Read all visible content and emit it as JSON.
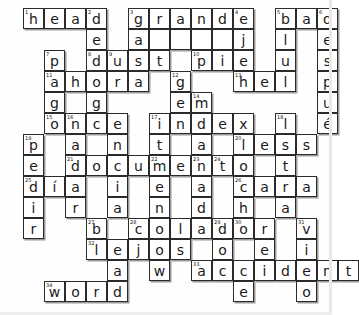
{
  "puzzle": {
    "title": "Crossword Puzzle",
    "grid_cols": 14,
    "grid_rows": 14,
    "cell_size": 21,
    "origin_x": 23,
    "origin_y": 8,
    "ink_color": "#2b2b2b",
    "shadow_color": "#9a9a9a",
    "background_color": "#ffffff",
    "cells": [
      {
        "r": 0,
        "c": 0,
        "letter": "h",
        "num": "1"
      },
      {
        "r": 0,
        "c": 1,
        "letter": "e",
        "num": ""
      },
      {
        "r": 0,
        "c": 2,
        "letter": "a",
        "num": ""
      },
      {
        "r": 0,
        "c": 3,
        "letter": "d",
        "num": "2"
      },
      {
        "r": 0,
        "c": 5,
        "letter": "g",
        "num": "3"
      },
      {
        "r": 0,
        "c": 6,
        "letter": "r",
        "num": ""
      },
      {
        "r": 0,
        "c": 7,
        "letter": "a",
        "num": ""
      },
      {
        "r": 0,
        "c": 8,
        "letter": "n",
        "num": ""
      },
      {
        "r": 0,
        "c": 9,
        "letter": "d",
        "num": ""
      },
      {
        "r": 0,
        "c": 10,
        "letter": "e",
        "num": "4"
      },
      {
        "r": 0,
        "c": 12,
        "letter": "b",
        "num": "5"
      },
      {
        "r": 0,
        "c": 13,
        "letter": "a",
        "num": ""
      },
      {
        "r": 0,
        "c": 14,
        "letter": "d",
        "num": "6"
      },
      {
        "r": 1,
        "c": 3,
        "letter": "e",
        "num": ""
      },
      {
        "r": 1,
        "c": 5,
        "letter": "a",
        "num": ""
      },
      {
        "r": 1,
        "c": 6,
        "letter": "",
        "num": ""
      },
      {
        "r": 1,
        "c": 7,
        "letter": "",
        "num": ""
      },
      {
        "r": 1,
        "c": 8,
        "letter": "",
        "num": ""
      },
      {
        "r": 1,
        "c": 9,
        "letter": "",
        "num": ""
      },
      {
        "r": 1,
        "c": 10,
        "letter": "j",
        "num": ""
      },
      {
        "r": 1,
        "c": 12,
        "letter": "l",
        "num": ""
      },
      {
        "r": 1,
        "c": 14,
        "letter": "e",
        "num": ""
      },
      {
        "r": 2,
        "c": 1,
        "letter": "p",
        "num": "7"
      },
      {
        "r": 2,
        "c": 3,
        "letter": "d",
        "num": "8"
      },
      {
        "r": 2,
        "c": 4,
        "letter": "u",
        "num": "9"
      },
      {
        "r": 2,
        "c": 5,
        "letter": "s",
        "num": ""
      },
      {
        "r": 2,
        "c": 6,
        "letter": "t",
        "num": ""
      },
      {
        "r": 2,
        "c": 8,
        "letter": "p",
        "num": "10"
      },
      {
        "r": 2,
        "c": 9,
        "letter": "i",
        "num": ""
      },
      {
        "r": 2,
        "c": 10,
        "letter": "e",
        "num": ""
      },
      {
        "r": 2,
        "c": 12,
        "letter": "u",
        "num": ""
      },
      {
        "r": 2,
        "c": 14,
        "letter": "s",
        "num": ""
      },
      {
        "r": 3,
        "c": 1,
        "letter": "a",
        "num": "11"
      },
      {
        "r": 3,
        "c": 2,
        "letter": "h",
        "num": ""
      },
      {
        "r": 3,
        "c": 3,
        "letter": "o",
        "num": ""
      },
      {
        "r": 3,
        "c": 4,
        "letter": "r",
        "num": ""
      },
      {
        "r": 3,
        "c": 5,
        "letter": "a",
        "num": ""
      },
      {
        "r": 3,
        "c": 7,
        "letter": "g",
        "num": "12"
      },
      {
        "r": 3,
        "c": 10,
        "letter": "h",
        "num": "13"
      },
      {
        "r": 3,
        "c": 11,
        "letter": "e",
        "num": ""
      },
      {
        "r": 3,
        "c": 12,
        "letter": "l",
        "num": ""
      },
      {
        "r": 3,
        "c": 14,
        "letter": "p",
        "num": ""
      },
      {
        "r": 4,
        "c": 1,
        "letter": "g",
        "num": ""
      },
      {
        "r": 4,
        "c": 3,
        "letter": "g",
        "num": ""
      },
      {
        "r": 4,
        "c": 7,
        "letter": "e",
        "num": ""
      },
      {
        "r": 4,
        "c": 8,
        "letter": "m",
        "num": "14"
      },
      {
        "r": 4,
        "c": 14,
        "letter": "u",
        "num": ""
      },
      {
        "r": 5,
        "c": 1,
        "letter": "o",
        "num": "15"
      },
      {
        "r": 5,
        "c": 2,
        "letter": "n",
        "num": "16"
      },
      {
        "r": 5,
        "c": 3,
        "letter": "c",
        "num": ""
      },
      {
        "r": 5,
        "c": 4,
        "letter": "e",
        "num": ""
      },
      {
        "r": 5,
        "c": 6,
        "letter": "i",
        "num": "17"
      },
      {
        "r": 5,
        "c": 7,
        "letter": "n",
        "num": ""
      },
      {
        "r": 5,
        "c": 8,
        "letter": "d",
        "num": ""
      },
      {
        "r": 5,
        "c": 9,
        "letter": "e",
        "num": ""
      },
      {
        "r": 5,
        "c": 10,
        "letter": "x",
        "num": ""
      },
      {
        "r": 5,
        "c": 12,
        "letter": "l",
        "num": "18"
      },
      {
        "r": 5,
        "c": 14,
        "letter": "é",
        "num": ""
      },
      {
        "r": 6,
        "c": 0,
        "letter": "p",
        "num": "19"
      },
      {
        "r": 6,
        "c": 2,
        "letter": "a",
        "num": ""
      },
      {
        "r": 6,
        "c": 4,
        "letter": "n",
        "num": ""
      },
      {
        "r": 6,
        "c": 6,
        "letter": "t",
        "num": ""
      },
      {
        "r": 6,
        "c": 8,
        "letter": "a",
        "num": ""
      },
      {
        "r": 6,
        "c": 10,
        "letter": "l",
        "num": "20"
      },
      {
        "r": 6,
        "c": 11,
        "letter": "e",
        "num": ""
      },
      {
        "r": 6,
        "c": 12,
        "letter": "s",
        "num": ""
      },
      {
        "r": 6,
        "c": 13,
        "letter": "s",
        "num": ""
      },
      {
        "r": 7,
        "c": 0,
        "letter": "e",
        "num": ""
      },
      {
        "r": 7,
        "c": 2,
        "letter": "d",
        "num": "21"
      },
      {
        "r": 7,
        "c": 3,
        "letter": "o",
        "num": ""
      },
      {
        "r": 7,
        "c": 4,
        "letter": "c",
        "num": ""
      },
      {
        "r": 7,
        "c": 5,
        "letter": "u",
        "num": ""
      },
      {
        "r": 7,
        "c": 6,
        "letter": "m",
        "num": "22"
      },
      {
        "r": 7,
        "c": 7,
        "letter": "e",
        "num": ""
      },
      {
        "r": 7,
        "c": 8,
        "letter": "n",
        "num": "23"
      },
      {
        "r": 7,
        "c": 9,
        "letter": "t",
        "num": "24"
      },
      {
        "r": 7,
        "c": 10,
        "letter": "o",
        "num": ""
      },
      {
        "r": 7,
        "c": 12,
        "letter": "t",
        "num": ""
      },
      {
        "r": 8,
        "c": 0,
        "letter": "d",
        "num": "25"
      },
      {
        "r": 8,
        "c": 1,
        "letter": "í",
        "num": ""
      },
      {
        "r": 8,
        "c": 2,
        "letter": "a",
        "num": ""
      },
      {
        "r": 8,
        "c": 4,
        "letter": "i",
        "num": ""
      },
      {
        "r": 8,
        "c": 6,
        "letter": "e",
        "num": ""
      },
      {
        "r": 8,
        "c": 8,
        "letter": "a",
        "num": ""
      },
      {
        "r": 8,
        "c": 10,
        "letter": "c",
        "num": "26"
      },
      {
        "r": 8,
        "c": 11,
        "letter": "a",
        "num": ""
      },
      {
        "r": 8,
        "c": 12,
        "letter": "r",
        "num": ""
      },
      {
        "r": 8,
        "c": 13,
        "letter": "a",
        "num": ""
      },
      {
        "r": 9,
        "c": 0,
        "letter": "i",
        "num": ""
      },
      {
        "r": 9,
        "c": 2,
        "letter": "r",
        "num": ""
      },
      {
        "r": 9,
        "c": 4,
        "letter": "a",
        "num": ""
      },
      {
        "r": 9,
        "c": 6,
        "letter": "n",
        "num": ""
      },
      {
        "r": 9,
        "c": 8,
        "letter": "d",
        "num": ""
      },
      {
        "r": 9,
        "c": 10,
        "letter": "h",
        "num": ""
      },
      {
        "r": 9,
        "c": 12,
        "letter": "a",
        "num": ""
      },
      {
        "r": 10,
        "c": 0,
        "letter": "r",
        "num": ""
      },
      {
        "r": 10,
        "c": 3,
        "letter": "b",
        "num": "27"
      },
      {
        "r": 10,
        "c": 5,
        "letter": "c",
        "num": "28"
      },
      {
        "r": 10,
        "c": 6,
        "letter": "o",
        "num": ""
      },
      {
        "r": 10,
        "c": 7,
        "letter": "l",
        "num": ""
      },
      {
        "r": 10,
        "c": 8,
        "letter": "a",
        "num": ""
      },
      {
        "r": 10,
        "c": 9,
        "letter": "d",
        "num": "29"
      },
      {
        "r": 10,
        "c": 10,
        "letter": "o",
        "num": "30"
      },
      {
        "r": 10,
        "c": 11,
        "letter": "r",
        "num": ""
      },
      {
        "r": 10,
        "c": 13,
        "letter": "v",
        "num": "31"
      },
      {
        "r": 11,
        "c": 3,
        "letter": "l",
        "num": "32"
      },
      {
        "r": 11,
        "c": 4,
        "letter": "e",
        "num": ""
      },
      {
        "r": 11,
        "c": 5,
        "letter": "j",
        "num": ""
      },
      {
        "r": 11,
        "c": 6,
        "letter": "o",
        "num": ""
      },
      {
        "r": 11,
        "c": 7,
        "letter": "s",
        "num": ""
      },
      {
        "r": 11,
        "c": 9,
        "letter": "o",
        "num": ""
      },
      {
        "r": 11,
        "c": 11,
        "letter": "e",
        "num": ""
      },
      {
        "r": 11,
        "c": 13,
        "letter": "i",
        "num": ""
      },
      {
        "r": 12,
        "c": 4,
        "letter": "a",
        "num": ""
      },
      {
        "r": 12,
        "c": 6,
        "letter": "w",
        "num": ""
      },
      {
        "r": 12,
        "c": 8,
        "letter": "a",
        "num": "33"
      },
      {
        "r": 12,
        "c": 9,
        "letter": "c",
        "num": ""
      },
      {
        "r": 12,
        "c": 10,
        "letter": "c",
        "num": ""
      },
      {
        "r": 12,
        "c": 11,
        "letter": "i",
        "num": ""
      },
      {
        "r": 12,
        "c": 12,
        "letter": "d",
        "num": ""
      },
      {
        "r": 12,
        "c": 13,
        "letter": "e",
        "num": ""
      },
      {
        "r": 12,
        "c": 14,
        "letter": "n",
        "num": ""
      },
      {
        "r": 12,
        "c": 15,
        "letter": "t",
        "num": ""
      },
      {
        "r": 13,
        "c": 1,
        "letter": "w",
        "num": "34"
      },
      {
        "r": 13,
        "c": 2,
        "letter": "o",
        "num": ""
      },
      {
        "r": 13,
        "c": 3,
        "letter": "r",
        "num": ""
      },
      {
        "r": 13,
        "c": 4,
        "letter": "d",
        "num": ""
      },
      {
        "r": 13,
        "c": 10,
        "letter": "e",
        "num": ""
      },
      {
        "r": 13,
        "c": 13,
        "letter": "o",
        "num": ""
      }
    ]
  }
}
